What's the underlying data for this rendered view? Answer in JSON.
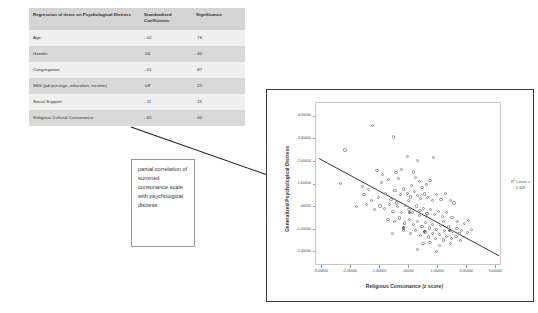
{
  "table": {
    "headers": [
      "Regression of items on Psychological Distress",
      "Standardized Coefficients",
      "Significance"
    ],
    "rows": [
      {
        "label": "Age",
        "coefficient": "-.02",
        "significance": ".76"
      },
      {
        "label": "Gender",
        "coefficient": ".06",
        "significance": ".40"
      },
      {
        "label": "Congregation",
        "coefficient": "-.01",
        "significance": ".87"
      },
      {
        "label": "SES (job prestige, education, income)",
        "coefficient": ".09",
        "significance": ".25"
      },
      {
        "label": "Social Support",
        "coefficient": "-.11",
        "significance": ".15"
      },
      {
        "label": "Religious Cultural Consonance",
        "coefficient": "-.65",
        "significance": ".00"
      }
    ]
  },
  "callout": {
    "text": "partial correlation of summed consonance scale with psychological distress"
  },
  "chart_data": {
    "type": "scatter",
    "title": "",
    "xlabel": "Religious Consonance (z score)",
    "ylabel": "Generalized Psychological Distress",
    "xlim": [
      -3.2,
      3.2
    ],
    "ylim": [
      -2.6,
      4.6
    ],
    "xticks": [
      "-3.00000",
      "-2.00000",
      "-1.00000",
      ".00000",
      "1.00000",
      "2.00000",
      "3.00000"
    ],
    "xtick_values": [
      -3,
      -2,
      -1,
      0,
      1,
      2,
      3
    ],
    "yticks": [
      "4.00000",
      "3.00000",
      "2.00000",
      "1.00000",
      ".00000",
      "-1.00000",
      "-2.00000"
    ],
    "ytick_values": [
      4,
      3,
      2,
      1,
      0,
      -1,
      -2
    ],
    "grid": false,
    "annotation_label": "R",
    "annotation_sup": "2",
    "annotation_rest": " Linear =",
    "annotation_value": "0.328",
    "fit_line": {
      "x0": -3.1,
      "y0": 2.15,
      "x1": 3.1,
      "y1": -2.15
    },
    "point_color": "#8a8a8a",
    "line_color": "#3a3a3a",
    "points": [
      [
        -1.25,
        3.62
      ],
      [
        -0.52,
        3.1
      ],
      [
        -2.2,
        2.52
      ],
      [
        -0.05,
        2.22
      ],
      [
        0.3,
        2.06
      ],
      [
        0.85,
        2.2
      ],
      [
        -2.35,
        1.05
      ],
      [
        -1.1,
        1.62
      ],
      [
        -0.9,
        1.45
      ],
      [
        -0.45,
        1.52
      ],
      [
        -0.35,
        1.28
      ],
      [
        -0.7,
        1.22
      ],
      [
        -0.95,
        1.08
      ],
      [
        0.22,
        1.3
      ],
      [
        0.35,
        1.12
      ],
      [
        0.6,
        1.0
      ],
      [
        0.72,
        1.18
      ],
      [
        -1.55,
        0.55
      ],
      [
        -1.3,
        0.28
      ],
      [
        -1.05,
        0.42
      ],
      [
        -0.8,
        0.62
      ],
      [
        -0.62,
        0.35
      ],
      [
        -0.48,
        0.72
      ],
      [
        -0.3,
        0.55
      ],
      [
        -0.18,
        0.8
      ],
      [
        -0.05,
        0.62
      ],
      [
        0.05,
        0.45
      ],
      [
        0.18,
        0.68
      ],
      [
        0.28,
        0.5
      ],
      [
        0.4,
        0.38
      ],
      [
        0.52,
        0.58
      ],
      [
        0.65,
        0.42
      ],
      [
        0.8,
        0.3
      ],
      [
        0.95,
        0.55
      ],
      [
        1.1,
        0.35
      ],
      [
        1.25,
        0.62
      ],
      [
        1.42,
        0.28
      ],
      [
        -1.8,
        0.02
      ],
      [
        -1.45,
        0.1
      ],
      [
        -1.2,
        -0.12
      ],
      [
        -1.0,
        0.05
      ],
      [
        -0.85,
        -0.05
      ],
      [
        -0.68,
        0.12
      ],
      [
        -0.55,
        -0.18
      ],
      [
        -0.4,
        0.02
      ],
      [
        -0.25,
        -0.25
      ],
      [
        -0.12,
        0.08
      ],
      [
        0.0,
        -0.1
      ],
      [
        0.12,
        -0.22
      ],
      [
        0.25,
        0.05
      ],
      [
        0.38,
        -0.15
      ],
      [
        0.5,
        -0.05
      ],
      [
        0.62,
        -0.28
      ],
      [
        0.75,
        -0.12
      ],
      [
        0.88,
        -0.32
      ],
      [
        1.02,
        -0.18
      ],
      [
        1.15,
        -0.4
      ],
      [
        1.3,
        -0.25
      ],
      [
        1.48,
        -0.45
      ],
      [
        -0.72,
        -0.55
      ],
      [
        -0.5,
        -0.62
      ],
      [
        -0.32,
        -0.48
      ],
      [
        -0.15,
        -0.7
      ],
      [
        0.02,
        -0.55
      ],
      [
        0.15,
        -0.78
      ],
      [
        0.3,
        -0.62
      ],
      [
        0.45,
        -0.85
      ],
      [
        0.58,
        -0.68
      ],
      [
        0.7,
        -0.92
      ],
      [
        0.82,
        -0.75
      ],
      [
        0.95,
        -0.98
      ],
      [
        1.08,
        -0.82
      ],
      [
        1.22,
        -1.02
      ],
      [
        1.35,
        -0.88
      ],
      [
        1.5,
        -1.08
      ],
      [
        1.65,
        -0.95
      ],
      [
        1.8,
        -1.05
      ],
      [
        2.0,
        -1.12
      ],
      [
        2.15,
        -1.0
      ],
      [
        -0.2,
        -1.05
      ],
      [
        0.05,
        -1.18
      ],
      [
        0.22,
        -1.02
      ],
      [
        0.4,
        -1.25
      ],
      [
        0.55,
        -1.1
      ],
      [
        0.68,
        -1.32
      ],
      [
        0.8,
        -1.15
      ],
      [
        0.92,
        -1.38
      ],
      [
        1.05,
        -1.22
      ],
      [
        1.18,
        -1.45
      ],
      [
        1.3,
        -1.3
      ],
      [
        1.45,
        -1.4
      ],
      [
        1.62,
        -1.28
      ],
      [
        1.78,
        -1.48
      ],
      [
        0.48,
        -1.62
      ],
      [
        0.72,
        -1.55
      ],
      [
        1.05,
        -1.7
      ],
      [
        1.42,
        -1.6
      ],
      [
        0.28,
        -1.88
      ],
      [
        0.95,
        -1.95
      ],
      [
        1.68,
        -0.62
      ],
      [
        1.92,
        -0.72
      ],
      [
        2.05,
        -0.58
      ],
      [
        -1.6,
        0.92
      ],
      [
        -0.25,
        1.68
      ],
      [
        0.08,
        0.95
      ],
      [
        0.45,
        0.85
      ],
      [
        1.55,
        0.18
      ],
      [
        -0.58,
        -1.18
      ],
      [
        0.6,
        -0.42
      ],
      [
        1.2,
        -0.65
      ],
      [
        -0.02,
        0.28
      ],
      [
        0.35,
        -0.38
      ],
      [
        -1.38,
        0.78
      ],
      [
        1.72,
        -1.18
      ],
      [
        0.15,
        1.55
      ],
      [
        -0.42,
        0.18
      ]
    ],
    "filled_points": [
      [
        0.02,
        -0.22
      ],
      [
        -0.18,
        -0.92
      ],
      [
        1.38,
        -1.02
      ],
      [
        0.52,
        -1.08
      ]
    ]
  }
}
